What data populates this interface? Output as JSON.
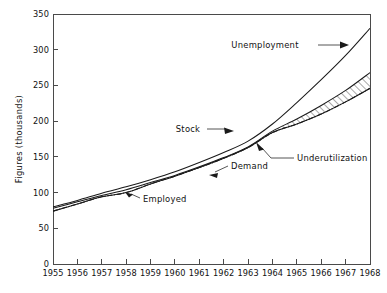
{
  "chart_data": {
    "type": "line",
    "title": "",
    "subtitle": "",
    "xlabel": "",
    "ylabel": "Figures (thousands)",
    "xlim": [
      1955,
      1968
    ],
    "ylim": [
      0,
      350
    ],
    "ytick_step": 50,
    "grid": false,
    "legend_position": "inline-annotations",
    "x": [
      1955,
      1956,
      1957,
      1958,
      1959,
      1960,
      1961,
      1962,
      1963,
      1964,
      1965,
      1966,
      1967,
      1968
    ],
    "ytick_labels": [
      "0",
      "50",
      "100",
      "150",
      "200",
      "250",
      "300",
      "350"
    ],
    "xtick_labels": [
      "1955",
      "1956",
      "1957",
      "1958",
      "1959",
      "1960",
      "1961",
      "1962",
      "1963",
      "1964",
      "1965",
      "1966",
      "1967",
      "1968"
    ],
    "series": [
      {
        "name": "Unemployment",
        "style": "solid",
        "values": [
          80,
          89,
          99,
          108,
          118,
          129,
          142,
          156,
          172,
          196,
          226,
          258,
          292,
          330
        ]
      },
      {
        "name": "Stock",
        "style": "solid",
        "values": [
          78,
          87,
          96,
          104,
          114,
          124,
          136,
          149,
          164,
          186,
          203,
          222,
          243,
          268
        ]
      },
      {
        "name": "Demand",
        "style": "dash-dot",
        "values": [
          74,
          84,
          94,
          100,
          112,
          123,
          135,
          148,
          163,
          184,
          196,
          210,
          227,
          246
        ]
      },
      {
        "name": "Employed",
        "style": "solid",
        "values": [
          74,
          84,
          94,
          100,
          112,
          123,
          135,
          148,
          163,
          184,
          196,
          210,
          227,
          246
        ]
      }
    ],
    "shaded_regions": [
      {
        "name": "Underutilization",
        "fill": "diagonal-hatch",
        "between": [
          "Stock",
          "Demand"
        ],
        "x_start": 1964,
        "x_end": 1968
      }
    ],
    "annotations": [
      {
        "label": "Unemployment",
        "x": 1964.0,
        "y": 297
      },
      {
        "label": "Stock",
        "x": 1960.3,
        "y": 196
      },
      {
        "label": "Underutilization",
        "x": 1964.6,
        "y": 150
      },
      {
        "label": "Demand",
        "x": 1962.2,
        "y": 140
      },
      {
        "label": "Employed",
        "x": 1958.7,
        "y": 101
      }
    ]
  },
  "colors": {
    "background": "#ffffff",
    "axis": "#4a4a4a",
    "line": "#1a1a1a",
    "text": "#111111"
  }
}
